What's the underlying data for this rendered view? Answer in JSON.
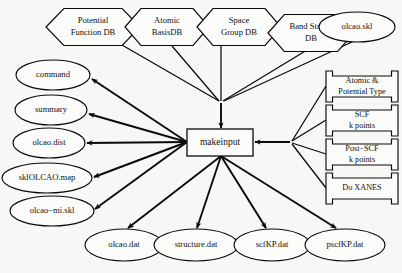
{
  "diagram": {
    "type": "flowchart",
    "background_color": "#f7f7f5",
    "line_color": "#0a0a0a",
    "node_fill": "#fbfbfa",
    "process": {
      "label": "makeinput",
      "shape": "rectangle",
      "x": 187,
      "y": 129,
      "w": 66,
      "h": 27,
      "font_size": 9.5
    },
    "databases": [
      {
        "label_line1": "Potential",
        "label_line2": "Function DB",
        "shape": "hexagon",
        "cx": 93,
        "cy": 27,
        "w": 94,
        "h": 37,
        "font_size": 8.6
      },
      {
        "label_line1": "Atomic",
        "label_line2": "BasisDB",
        "shape": "hexagon",
        "cx": 167,
        "cy": 27,
        "w": 84,
        "h": 37,
        "font_size": 8.6
      },
      {
        "label_line1": "Space",
        "label_line2": "Group DB",
        "shape": "hexagon",
        "cx": 239,
        "cy": 27,
        "w": 84,
        "h": 37,
        "font_size": 8.6
      },
      {
        "label_line1": "Band Struct.",
        "label_line2": "DB",
        "shape": "hexagon",
        "cx": 311,
        "cy": 33,
        "w": 86,
        "h": 37,
        "font_size": 8.6
      }
    ],
    "skeleton_input": {
      "label": "olcao.skl",
      "shape": "ellipse",
      "cx": 357,
      "cy": 27,
      "rx": 38,
      "ry": 15,
      "font_size": 8.6
    },
    "option_panels": [
      {
        "label_line1": "Atomic &",
        "label_line2": "Potential Type",
        "shape": "folder",
        "x": 326,
        "y": 71,
        "w": 72,
        "h": 31,
        "font_size": 8.2
      },
      {
        "label_line1": "SCF",
        "label_line2": "k points",
        "shape": "folder",
        "x": 326,
        "y": 105,
        "w": 72,
        "h": 31,
        "font_size": 8.2
      },
      {
        "label_line1": "Post−SCF",
        "label_line2": "k points",
        "shape": "folder",
        "x": 326,
        "y": 139,
        "w": 72,
        "h": 31,
        "font_size": 8.2
      },
      {
        "label_line1": "Do XANES",
        "label_line2": "",
        "shape": "folder",
        "x": 326,
        "y": 173,
        "w": 72,
        "h": 31,
        "font_size": 8.2
      }
    ],
    "left_outputs": [
      {
        "label": "command",
        "shape": "ellipse",
        "cx": 53,
        "cy": 75,
        "rx": 37,
        "ry": 15,
        "font_size": 8.6
      },
      {
        "label": "summary",
        "shape": "ellipse",
        "cx": 51,
        "cy": 110,
        "rx": 36,
        "ry": 15,
        "font_size": 8.6
      },
      {
        "label": "olcao.dist",
        "shape": "ellipse",
        "cx": 49,
        "cy": 143,
        "rx": 36,
        "ry": 15,
        "font_size": 8.6
      },
      {
        "label": "sklOLCAO.map",
        "shape": "ellipse",
        "cx": 47,
        "cy": 178,
        "rx": 45,
        "ry": 15,
        "font_size": 8.6
      },
      {
        "label": "olcao−mi.skl",
        "shape": "ellipse",
        "cx": 52,
        "cy": 211,
        "rx": 42,
        "ry": 15,
        "font_size": 8.6
      }
    ],
    "bottom_outputs": [
      {
        "label": "olcao.dat",
        "shape": "ellipse",
        "cx": 124,
        "cy": 245,
        "rx": 39,
        "ry": 16,
        "font_size": 8.6
      },
      {
        "label": "structure.dat",
        "shape": "ellipse",
        "cx": 196,
        "cy": 245,
        "rx": 42,
        "ry": 16,
        "font_size": 8.6
      },
      {
        "label": "scfKP.dat",
        "shape": "ellipse",
        "cx": 272,
        "cy": 245,
        "rx": 38,
        "ry": 16,
        "font_size": 8.6
      },
      {
        "label": "pscfKP.dat",
        "shape": "ellipse",
        "cx": 345,
        "cy": 245,
        "rx": 40,
        "ry": 16,
        "font_size": 8.6
      }
    ],
    "junctions": {
      "top_merge": {
        "x": 221,
        "y": 103
      },
      "right_merge": {
        "x": 290,
        "y": 142
      },
      "left_fan": {
        "x": 187,
        "y": 142
      },
      "bottom_fan": {
        "x": 221,
        "y": 156
      }
    },
    "edges": [
      {
        "from": "Potential Function DB",
        "to": "top_merge",
        "x1": 122,
        "y1": 45,
        "x2": 219,
        "y2": 101,
        "arrow": false
      },
      {
        "from": "Atomic BasisDB",
        "to": "top_merge",
        "x1": 172,
        "y1": 46,
        "x2": 219,
        "y2": 101,
        "arrow": false
      },
      {
        "from": "Space Group DB",
        "to": "top_merge",
        "x1": 221,
        "y1": 46,
        "x2": 221,
        "y2": 101,
        "arrow": false
      },
      {
        "from": "Band Struct. DB",
        "to": "top_merge",
        "x1": 307,
        "y1": 50,
        "x2": 223,
        "y2": 101,
        "arrow": false
      },
      {
        "from": "olcao.skl",
        "to": "top_merge",
        "x1": 352,
        "y1": 42,
        "x2": 224,
        "y2": 101,
        "arrow": false
      },
      {
        "from": "top_merge",
        "to": "makeinput",
        "x1": 221,
        "y1": 103,
        "x2": 221,
        "y2": 128,
        "arrow": true
      },
      {
        "from": "Atomic & Potential Type",
        "to": "right_merge",
        "x1": 326,
        "y1": 86,
        "x2": 292,
        "y2": 141,
        "arrow": false
      },
      {
        "from": "SCF k points",
        "to": "right_merge",
        "x1": 326,
        "y1": 120,
        "x2": 292,
        "y2": 141,
        "arrow": false
      },
      {
        "from": "Post-SCF k points",
        "to": "right_merge",
        "x1": 326,
        "y1": 154,
        "x2": 292,
        "y2": 143,
        "arrow": false
      },
      {
        "from": "Do XANES",
        "to": "right_merge",
        "x1": 326,
        "y1": 188,
        "x2": 292,
        "y2": 144,
        "arrow": false
      },
      {
        "from": "right_merge",
        "to": "makeinput",
        "x1": 290,
        "y1": 142,
        "x2": 255,
        "y2": 142,
        "arrow": true
      },
      {
        "from": "makeinput",
        "to": "command",
        "x1": 187,
        "y1": 142,
        "x2": 92,
        "y2": 79,
        "arrow": true
      },
      {
        "from": "makeinput",
        "to": "summary",
        "x1": 187,
        "y1": 142,
        "x2": 89,
        "y2": 114,
        "arrow": true
      },
      {
        "from": "makeinput",
        "to": "olcao.dist",
        "x1": 187,
        "y1": 142,
        "x2": 87,
        "y2": 143,
        "arrow": true
      },
      {
        "from": "makeinput",
        "to": "sklOLCAO.map",
        "x1": 187,
        "y1": 142,
        "x2": 94,
        "y2": 177,
        "arrow": true
      },
      {
        "from": "makeinput",
        "to": "olcao−mi.skl",
        "x1": 187,
        "y1": 142,
        "x2": 95,
        "y2": 209,
        "arrow": true
      },
      {
        "from": "makeinput",
        "to": "olcao.dat",
        "x1": 221,
        "y1": 156,
        "x2": 128,
        "y2": 228,
        "arrow": true
      },
      {
        "from": "makeinput",
        "to": "structure.dat",
        "x1": 221,
        "y1": 156,
        "x2": 197,
        "y2": 228,
        "arrow": true
      },
      {
        "from": "makeinput",
        "to": "scfKP.dat",
        "x1": 221,
        "y1": 156,
        "x2": 266,
        "y2": 228,
        "arrow": true
      },
      {
        "from": "makeinput",
        "to": "pscfKP.dat",
        "x1": 221,
        "y1": 156,
        "x2": 336,
        "y2": 228,
        "arrow": true
      }
    ]
  }
}
